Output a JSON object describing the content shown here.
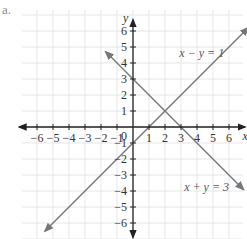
{
  "problem_label": "a.",
  "chart_data": {
    "type": "line",
    "title": "",
    "xlabel": "x",
    "ylabel": "y",
    "xlim": [
      -6,
      6
    ],
    "ylim": [
      -6,
      6
    ],
    "grid": true,
    "x_ticks": [
      -6,
      -5,
      -4,
      -3,
      -2,
      -1,
      1,
      2,
      3,
      4,
      5,
      6
    ],
    "y_ticks": [
      6,
      5,
      4,
      3,
      2,
      1,
      -1,
      -2,
      -3,
      -4,
      -5,
      -6
    ],
    "x_tick_labels": [
      "−6",
      "−5",
      "−4",
      "−3",
      "−2",
      "−1",
      "1",
      "2",
      "3",
      "4",
      "5",
      "6"
    ],
    "y_tick_labels": [
      "6",
      "5",
      "4",
      "3",
      "2",
      "1",
      "−1",
      "−2",
      "−3",
      "−4",
      "−5",
      "−6"
    ],
    "origin_label": "0",
    "series": [
      {
        "name": "x − y = 1",
        "equation": "y = x - 1",
        "slope": 1,
        "intercept": -1,
        "x_range": [
          -5.5,
          7.2
        ]
      },
      {
        "name": "x + y = 3",
        "equation": "y = -x + 3",
        "slope": -1,
        "intercept": 3,
        "x_range": [
          -1.7,
          6.9
        ]
      }
    ],
    "intersection": {
      "x": 2,
      "y": 1
    },
    "annotations": [
      {
        "text": "x − y = 1",
        "x": 4.3,
        "y": 4.4
      },
      {
        "text": "x + y = 3",
        "x": 4.6,
        "y": -4.0
      }
    ],
    "colors": {
      "axes": "#222222",
      "lines": "#777777",
      "grid": "#e6e6e6"
    }
  }
}
